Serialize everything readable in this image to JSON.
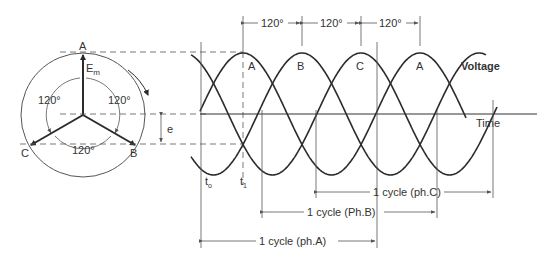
{
  "figure": {
    "phasor": {
      "labels": {
        "a": "A",
        "b": "B",
        "c": "C",
        "em": "E",
        "em_sub": "m",
        "e": "e"
      },
      "angles": {
        "left": "120°",
        "right": "120°",
        "bottom": "120°"
      }
    },
    "waveform": {
      "peak_labels": [
        "A",
        "B",
        "C",
        "A"
      ],
      "spacing_labels": [
        "120°",
        "120°",
        "120°"
      ],
      "voltage_label": "Voltage",
      "time_label": "Time",
      "t0": {
        "main": "t",
        "sub": "o"
      },
      "t1": {
        "main": "t",
        "sub": "1"
      },
      "cycle_labels": {
        "a": "1 cycle (ph.A)",
        "b": "1 cycle (Ph.B)",
        "c": "1 cycle (ph.C)"
      }
    },
    "colors": {
      "line": "#2b2b2b",
      "thin": "#555555",
      "text": "#333333"
    }
  }
}
